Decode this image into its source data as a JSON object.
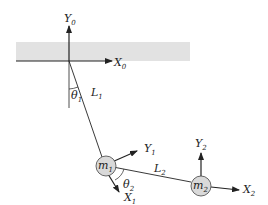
{
  "figure": {
    "ground_color": "#e2e2e2",
    "mass_fill": "#d9d9d9",
    "line_color": "#222222"
  },
  "labels": {
    "y0": {
      "base": "Y",
      "sub": "0"
    },
    "x0": {
      "base": "X",
      "sub": "0"
    },
    "theta1": {
      "base": "θ",
      "sub": "1"
    },
    "l1": {
      "base": "L",
      "sub": "1"
    },
    "m1": {
      "base": "m",
      "sub": "1"
    },
    "y1": {
      "base": "Y",
      "sub": "1"
    },
    "x1": {
      "base": "X",
      "sub": "1"
    },
    "theta2": {
      "base": "θ",
      "sub": "2"
    },
    "l2": {
      "base": "L",
      "sub": "2"
    },
    "m2": {
      "base": "m",
      "sub": "2"
    },
    "y2": {
      "base": "Y",
      "sub": "2"
    },
    "x2": {
      "base": "X",
      "sub": "2"
    }
  }
}
